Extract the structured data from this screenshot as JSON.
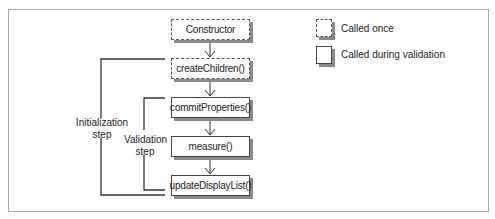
{
  "diagram": {
    "nodes": [
      {
        "id": "constructor",
        "label": "Constructor",
        "style": "dashed"
      },
      {
        "id": "createChildren",
        "label": "createChildren()",
        "style": "dashed"
      },
      {
        "id": "commitProperties",
        "label": "commitProperties()",
        "style": "solid"
      },
      {
        "id": "measure",
        "label": "measure()",
        "style": "solid"
      },
      {
        "id": "updateDisplayList",
        "label": "updateDisplayList()",
        "style": "solid"
      }
    ],
    "edges": [
      {
        "from": "constructor",
        "to": "createChildren"
      },
      {
        "from": "createChildren",
        "to": "commitProperties"
      },
      {
        "from": "commitProperties",
        "to": "measure"
      },
      {
        "from": "measure",
        "to": "updateDisplayList"
      }
    ],
    "brackets": [
      {
        "id": "initialization",
        "label_line1": "Initialization",
        "label_line2": "step",
        "spans": [
          "createChildren",
          "updateDisplayList"
        ]
      },
      {
        "id": "validation",
        "label_line1": "Validation",
        "label_line2": "step",
        "spans": [
          "commitProperties",
          "updateDisplayList"
        ]
      }
    ],
    "legend": [
      {
        "style": "dashed",
        "label": "Called once"
      },
      {
        "style": "solid",
        "label": "Called during validation"
      }
    ]
  }
}
